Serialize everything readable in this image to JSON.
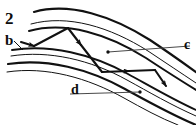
{
  "figure": {
    "kind": "line-diagram",
    "background_color": "#ffffff",
    "ink_color": "#111111",
    "labels": [
      {
        "id": "figure-number",
        "text": "2"
      },
      {
        "id": "b",
        "text": "b"
      },
      {
        "id": "c",
        "text": "c"
      },
      {
        "id": "d",
        "text": "d"
      }
    ],
    "bands": {
      "upper_band_lines": 3,
      "lower_band_lines": 4,
      "line_weights": [
        "thick",
        "thin",
        "thick",
        "thin"
      ]
    },
    "leaders": [
      {
        "id": "leader-b",
        "from_label": "b",
        "style": "thin-slanted"
      },
      {
        "id": "leader-c",
        "from_label": "c",
        "style": "thin-horizontal-with-dot"
      },
      {
        "id": "leader-d",
        "from_label": "d",
        "style": "thin-horizontal-with-dot"
      }
    ],
    "ray_path": {
      "arrowheads": 5,
      "direction": "left-to-right zigzag"
    }
  }
}
